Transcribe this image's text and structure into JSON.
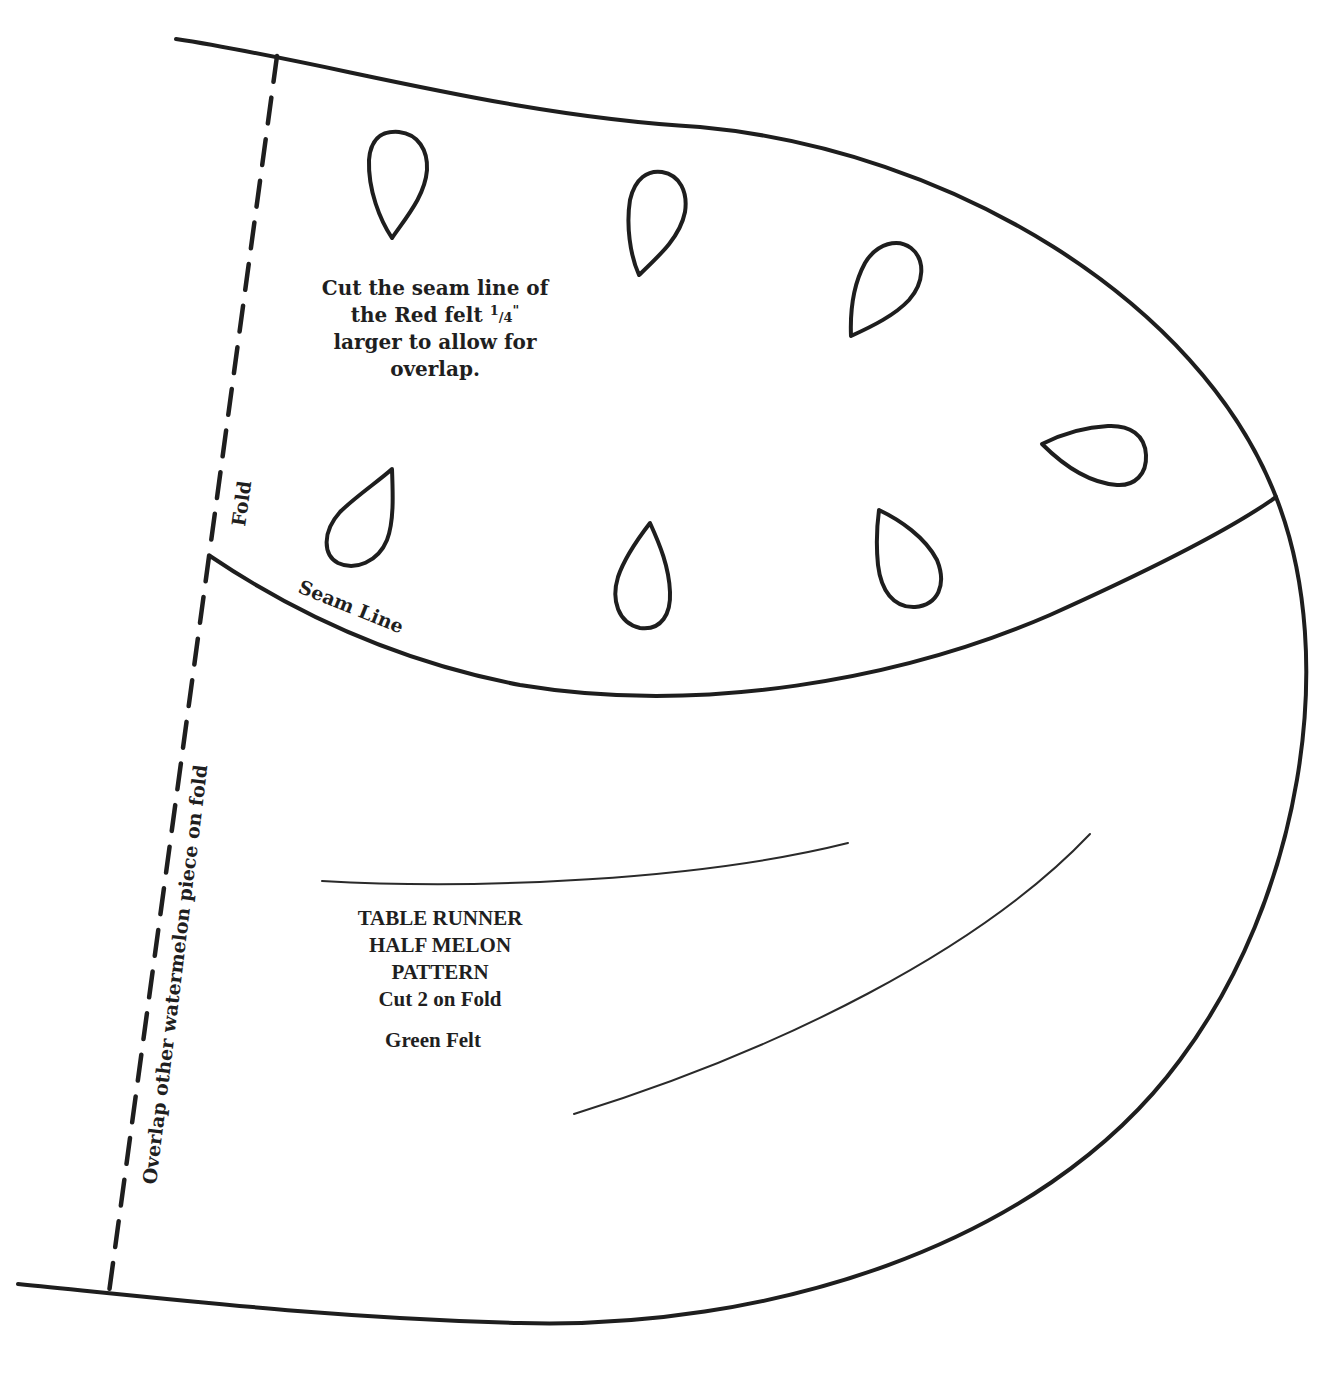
{
  "pattern": {
    "title_lines": [
      "TABLE RUNNER",
      "HALF MELON",
      "PATTERN",
      "Cut 2 on Fold"
    ],
    "material": "Green Felt",
    "red_felt_note": {
      "line1": "Cut the seam line of",
      "line2_prefix": "the Red felt ",
      "fraction_num": "1",
      "fraction_sep": "/",
      "fraction_den": "4",
      "fraction_suffix": "\"",
      "line3": "larger to allow for",
      "line4": "overlap."
    },
    "labels": {
      "fold": "Fold",
      "seam_line": "Seam Line",
      "overlap_fold": "Overlap other watermelon piece on fold"
    },
    "seed_count": 7,
    "colors": {
      "line": "#1e1e1e",
      "background": "#ffffff"
    }
  }
}
